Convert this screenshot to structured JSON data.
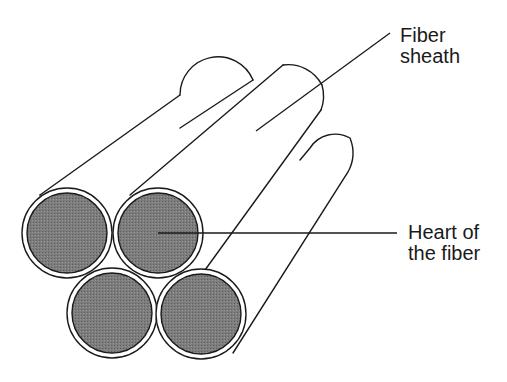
{
  "diagram": {
    "labels": {
      "sheath": {
        "line1": "Fiber",
        "line2": "sheath"
      },
      "heart": {
        "line1": "Heart of",
        "line2": "the fiber"
      }
    },
    "colors": {
      "stroke": "#1a1a1a",
      "core_fill": "#7a7a7a",
      "background": "#ffffff"
    }
  }
}
